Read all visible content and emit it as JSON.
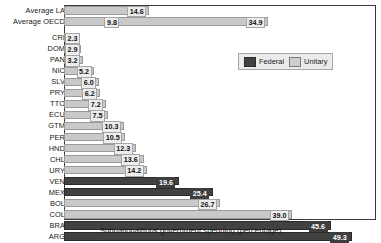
{
  "chart_data": {
    "type": "bar",
    "orientation": "horizontal",
    "title": "",
    "xlabel": "Subnational/total government spending (percentage)",
    "ylabel": "",
    "xlim": [
      0,
      53
    ],
    "grid": false,
    "legend_position": "top-right",
    "legend": [
      {
        "name": "Federal",
        "color": "#414141"
      },
      {
        "name": "Unitary",
        "color": "#c9c9c9"
      }
    ],
    "categories": [
      "Average LA",
      "Average OECD",
      "CRI",
      "DOM",
      "PAN",
      "NIC",
      "SLV",
      "PRY",
      "TTO",
      "ECU",
      "GTM",
      "PER",
      "HND",
      "CHL",
      "URY",
      "VEN",
      "MEX",
      "BOL",
      "COL",
      "BRA",
      "ARG"
    ],
    "values": [
      14.6,
      34.9,
      2.3,
      2.9,
      3.2,
      5.2,
      6.0,
      6.2,
      7.2,
      7.5,
      10.3,
      10.5,
      12.3,
      13.6,
      14.2,
      19.6,
      25.4,
      26.7,
      39.0,
      45.6,
      49.3
    ],
    "groups": [
      "unitary",
      "unitary",
      "unitary",
      "unitary",
      "unitary",
      "unitary",
      "unitary",
      "unitary",
      "unitary",
      "unitary",
      "unitary",
      "unitary",
      "unitary",
      "unitary",
      "unitary",
      "federal",
      "federal",
      "unitary",
      "unitary",
      "federal",
      "federal"
    ],
    "annotations": [
      {
        "category": "Average OECD",
        "text": "9.8",
        "value": 9.8
      }
    ],
    "rows": [
      {
        "cat": "Average LA",
        "value": 14.6,
        "label": "14.6",
        "group": "unitary"
      },
      {
        "cat": "Average OECD",
        "value": 34.9,
        "label": "34.9",
        "group": "unitary",
        "extra_label": "9.8",
        "extra_value": 9.8
      },
      {
        "cat": "CRI",
        "value": 2.3,
        "label": "2.3",
        "group": "unitary"
      },
      {
        "cat": "DOM",
        "value": 2.9,
        "label": "2.9",
        "group": "unitary"
      },
      {
        "cat": "PAN",
        "value": 3.2,
        "label": "3.2",
        "group": "unitary"
      },
      {
        "cat": "NIC",
        "value": 5.2,
        "label": "5.2",
        "group": "unitary"
      },
      {
        "cat": "SLV",
        "value": 6.0,
        "label": "6.0",
        "group": "unitary"
      },
      {
        "cat": "PRY",
        "value": 6.2,
        "label": "6.2",
        "group": "unitary"
      },
      {
        "cat": "TTO",
        "value": 7.2,
        "label": "7.2",
        "group": "unitary"
      },
      {
        "cat": "ECU",
        "value": 7.5,
        "label": "7.5",
        "group": "unitary"
      },
      {
        "cat": "GTM",
        "value": 10.3,
        "label": "10.3",
        "group": "unitary"
      },
      {
        "cat": "PER",
        "value": 10.5,
        "label": "10.5",
        "group": "unitary"
      },
      {
        "cat": "HND",
        "value": 12.3,
        "label": "12.3",
        "group": "unitary"
      },
      {
        "cat": "CHL",
        "value": 13.6,
        "label": "13.6",
        "group": "unitary"
      },
      {
        "cat": "URY",
        "value": 14.2,
        "label": "14.2",
        "group": "unitary"
      },
      {
        "cat": "VEN",
        "value": 19.6,
        "label": "19.6",
        "group": "federal"
      },
      {
        "cat": "MEX",
        "value": 25.4,
        "label": "25.4",
        "group": "federal"
      },
      {
        "cat": "BOL",
        "value": 26.7,
        "label": "26.7",
        "group": "unitary"
      },
      {
        "cat": "COL",
        "value": 39.0,
        "label": "39.0",
        "group": "unitary"
      },
      {
        "cat": "BRA",
        "value": 45.6,
        "label": "45.6",
        "group": "federal"
      },
      {
        "cat": "ARG",
        "value": 49.3,
        "label": "49.3",
        "group": "federal"
      }
    ]
  }
}
